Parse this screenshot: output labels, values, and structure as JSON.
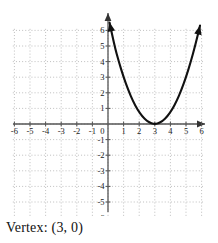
{
  "caption": {
    "text": "Vertex: (3, 0)"
  },
  "axes": {
    "x_label": "x",
    "y_label": "y",
    "x_ticks": [
      "-6",
      "-5",
      "-4",
      "-3",
      "-2",
      "-1",
      "0",
      "1",
      "2",
      "3",
      "4",
      "5",
      "6"
    ],
    "y_ticks": [
      "6",
      "5",
      "4",
      "3",
      "2",
      "1",
      "-1",
      "-2",
      "-3",
      "-4",
      "-5",
      "-6"
    ],
    "origin_label": "0"
  },
  "colors": {
    "curve": "#111111",
    "axis": "#555555",
    "grid": "#b8b8b8",
    "text": "#1a1a1a",
    "background": "#ffffff"
  },
  "chart_data": {
    "type": "line",
    "title": "",
    "subtitle": "",
    "xlabel": "x",
    "ylabel": "y",
    "xlim": [
      -6.5,
      6.5
    ],
    "ylim": [
      -6.5,
      6.5
    ],
    "xticks": [
      -6,
      -5,
      -4,
      -3,
      -2,
      -1,
      0,
      1,
      2,
      3,
      4,
      5,
      6
    ],
    "yticks": [
      -6,
      -5,
      -4,
      -3,
      -2,
      -1,
      0,
      1,
      2,
      3,
      4,
      5,
      6
    ],
    "grid": true,
    "grid_style": "dotted",
    "legend": false,
    "annotations": [
      {
        "text": "Vertex: (3, 0)",
        "x": 3,
        "y": 0
      }
    ],
    "series": [
      {
        "name": "y = 0.75(x - 3)^2",
        "equation": "y = 0.75(x - 3)^2",
        "vertex": [
          3,
          0
        ],
        "opens": "up",
        "coefficient": 0.75,
        "x": [
          0.1,
          0.4,
          0.7,
          1.0,
          1.3,
          1.6,
          1.9,
          2.2,
          2.5,
          2.8,
          3.0,
          3.2,
          3.5,
          3.8,
          4.1,
          4.4,
          4.7,
          5.0,
          5.3,
          5.6,
          5.9
        ],
        "values": [
          6.51,
          5.07,
          3.97,
          3.0,
          2.17,
          1.47,
          0.91,
          0.48,
          0.19,
          0.03,
          0.0,
          0.03,
          0.19,
          0.48,
          0.91,
          1.47,
          2.17,
          3.0,
          3.97,
          5.07,
          6.31
        ]
      }
    ]
  }
}
